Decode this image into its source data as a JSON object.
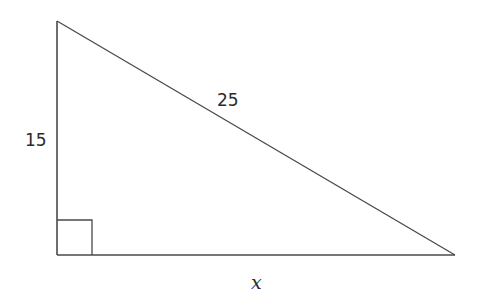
{
  "diagram": {
    "shape": "right triangle",
    "labels": {
      "vertical_leg": "15",
      "hypotenuse": "25",
      "horizontal_leg": "x"
    },
    "right_angle_marker": true,
    "stroke_color": "#4a4a4a"
  }
}
